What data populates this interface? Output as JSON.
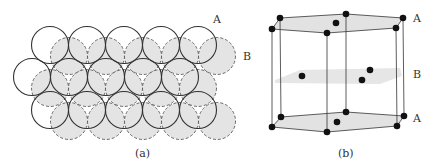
{
  "panel_a": {
    "caption": "(a)",
    "layer_a_label": "A",
    "layer_b_label": "B",
    "radius": 18.5,
    "layer_a_circles": [
      [
        50,
        45
      ],
      [
        87,
        45
      ],
      [
        124,
        45
      ],
      [
        161,
        45
      ],
      [
        198,
        45
      ],
      [
        32,
        77
      ],
      [
        69,
        77
      ],
      [
        106,
        77
      ],
      [
        143,
        77
      ],
      [
        180,
        77
      ],
      [
        50,
        110
      ],
      [
        87,
        110
      ],
      [
        124,
        110
      ],
      [
        161,
        110
      ],
      [
        198,
        110
      ]
    ],
    "layer_b_circles": [
      [
        69,
        56
      ],
      [
        106,
        56
      ],
      [
        143,
        56
      ],
      [
        180,
        56
      ],
      [
        217,
        56
      ],
      [
        50,
        88
      ],
      [
        87,
        88
      ],
      [
        124,
        88
      ],
      [
        161,
        88
      ],
      [
        198,
        88
      ],
      [
        69,
        121
      ],
      [
        106,
        121
      ],
      [
        143,
        121
      ],
      [
        180,
        121
      ],
      [
        217,
        121
      ]
    ]
  },
  "panel_b": {
    "caption": "(b)",
    "top_label": "A",
    "middle_label": "B",
    "bottom_label": "A"
  },
  "colors": {
    "layer_b_fill": "#e4e4e4",
    "stroke": "#333333",
    "atom": "#111111"
  }
}
